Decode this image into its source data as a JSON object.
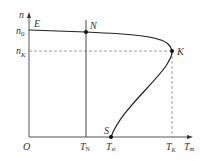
{
  "diagram": {
    "type": "motor mechanical characteristic (speed vs torque)",
    "axes": {
      "y_label": "n",
      "x_label": "T",
      "x_label_sub": "m",
      "origin_label": "O"
    },
    "y_ticks": [
      {
        "main": "n",
        "sub": "0"
      },
      {
        "main": "n",
        "sub": "K"
      }
    ],
    "x_ticks": [
      {
        "main": "T",
        "sub": "N"
      },
      {
        "main": "T",
        "sub": "st"
      },
      {
        "main": "T",
        "sub": "K"
      }
    ],
    "points": [
      {
        "label": "E"
      },
      {
        "label": "N"
      },
      {
        "label": "K"
      },
      {
        "label": "S"
      }
    ],
    "colors": {
      "axis": "#555555",
      "curve": "#222222",
      "dashed": "#888888",
      "text": "#333333"
    }
  }
}
